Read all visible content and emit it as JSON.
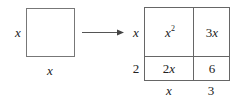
{
  "diagram": {
    "left_square": {
      "side_label": "x",
      "bottom_label": "x"
    },
    "arrow": {
      "direction": "right"
    },
    "right_grid": {
      "row_labels": [
        "x",
        "2"
      ],
      "col_labels": [
        "x",
        "3"
      ],
      "cells": [
        [
          {
            "base": "x",
            "sup": "2"
          },
          {
            "text": "3x"
          }
        ],
        [
          {
            "text": "2x"
          },
          {
            "text": "6"
          }
        ]
      ]
    },
    "colors": {
      "line": "#666666",
      "text": "#222222"
    }
  }
}
